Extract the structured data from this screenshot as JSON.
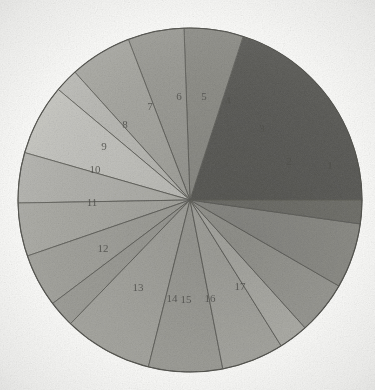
{
  "page": {
    "background_color": "#fdfdfc"
  },
  "chart_data": {
    "type": "pie",
    "title": "",
    "subtitle": "",
    "xlabel": "",
    "ylabel": "",
    "grid": false,
    "legend_position": "none",
    "center_x": 190,
    "center_y": 200,
    "radius": 172,
    "start_angle_deg": 0,
    "direction": "counterclockwise",
    "labels_are_sector_numbers": true,
    "categories": [
      "1",
      "2",
      "3",
      "4",
      "5",
      "6",
      "7",
      "8",
      "9",
      "10",
      "11",
      "12",
      "13",
      "14",
      "15",
      "16",
      "17"
    ],
    "values": [
      72,
      20,
      19,
      21,
      8,
      24,
      17,
      18,
      18,
      9,
      30,
      25,
      21,
      10,
      18,
      22,
      8
    ],
    "total": 360,
    "units": "degrees",
    "slices": [
      {
        "label": "1",
        "start_deg": 0,
        "sweep_deg": 72,
        "color": "#5a5a57",
        "label_x": 330,
        "label_y": 166
      },
      {
        "label": "2",
        "start_deg": 72,
        "sweep_deg": 20,
        "color": "#8e8e89",
        "label_x": 289,
        "label_y": 162
      },
      {
        "label": "3",
        "start_deg": 92,
        "sweep_deg": 19,
        "color": "#9b9b96",
        "label_x": 262,
        "label_y": 129
      },
      {
        "label": "4",
        "start_deg": 111,
        "sweep_deg": 21,
        "color": "#a7a7a2",
        "label_x": 228,
        "label_y": 101
      },
      {
        "label": "5",
        "start_deg": 132,
        "sweep_deg": 8,
        "color": "#bcbcb7",
        "label_x": 204,
        "label_y": 97
      },
      {
        "label": "6",
        "start_deg": 140,
        "sweep_deg": 24,
        "color": "#c6c6c1",
        "label_x": 179,
        "label_y": 97
      },
      {
        "label": "7",
        "start_deg": 164,
        "sweep_deg": 17,
        "color": "#b4b4af",
        "label_x": 150,
        "label_y": 107
      },
      {
        "label": "8",
        "start_deg": 181,
        "sweep_deg": 18,
        "color": "#aaaaa5",
        "label_x": 125,
        "label_y": 125
      },
      {
        "label": "9",
        "start_deg": 199,
        "sweep_deg": 18,
        "color": "#a2a29d",
        "label_x": 104,
        "label_y": 147
      },
      {
        "label": "10",
        "start_deg": 217,
        "sweep_deg": 9,
        "color": "#9d9d98",
        "label_x": 95,
        "label_y": 170
      },
      {
        "label": "11",
        "start_deg": 226,
        "sweep_deg": 30,
        "color": "#a6a6a1",
        "label_x": 92,
        "label_y": 203
      },
      {
        "label": "12",
        "start_deg": 256,
        "sweep_deg": 25,
        "color": "#9f9f9a",
        "label_x": 103,
        "label_y": 249
      },
      {
        "label": "13",
        "start_deg": 281,
        "sweep_deg": 21,
        "color": "#a8a8a3",
        "label_x": 138,
        "label_y": 288
      },
      {
        "label": "14",
        "start_deg": 302,
        "sweep_deg": 10,
        "color": "#b0b0ab",
        "label_x": 172,
        "label_y": 299
      },
      {
        "label": "15",
        "start_deg": 312,
        "sweep_deg": 18,
        "color": "#9a9a95",
        "label_x": 186,
        "label_y": 300
      },
      {
        "label": "16",
        "start_deg": 330,
        "sweep_deg": 22,
        "color": "#8d8d88",
        "label_x": 210,
        "label_y": 299
      },
      {
        "label": "17",
        "start_deg": 352,
        "sweep_deg": 8,
        "color": "#6f6f6b",
        "label_x": 240,
        "label_y": 287
      }
    ]
  }
}
